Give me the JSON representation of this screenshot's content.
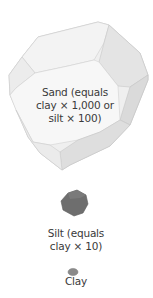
{
  "figure": {
    "particles": [
      {
        "id": "sand",
        "lines": [
          "Sand (equals",
          "clay × 1,000 or",
          "silt × 100)"
        ]
      },
      {
        "id": "silt",
        "lines": [
          "Silt (equals",
          "clay × 10)"
        ]
      },
      {
        "id": "clay",
        "lines": [
          "Clay"
        ]
      }
    ],
    "colors": {
      "sand_light": "#f4f4f4",
      "sand_mid": "#e6e6e6",
      "sand_dark": "#d8d8d8",
      "sand_edge": "#c4c4c4",
      "silt": "#6e6e6e",
      "clay": "#8a8a8a",
      "text": "#3a3a3a"
    }
  }
}
